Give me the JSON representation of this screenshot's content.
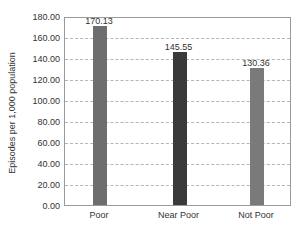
{
  "chart_data": {
    "type": "bar",
    "title": "",
    "xlabel": "",
    "ylabel": "Episodes per 1,000 population",
    "categories": [
      "Poor",
      "Near Poor",
      "Not Poor"
    ],
    "values": [
      170.13,
      145.55,
      130.36
    ],
    "value_labels": [
      "170.13",
      "145.55",
      "130.36"
    ],
    "ylim": [
      0,
      180
    ],
    "yticks": [
      "0.00",
      "20.00",
      "40.00",
      "60.00",
      "80.00",
      "100.00",
      "120.00",
      "140.00",
      "160.00",
      "180.00"
    ],
    "grid": true,
    "grid_style": "dashed horizontal",
    "legend": "none",
    "bar_colors": [
      "#6e6e6e",
      "#3a3a3a",
      "#7a7a7a"
    ]
  }
}
